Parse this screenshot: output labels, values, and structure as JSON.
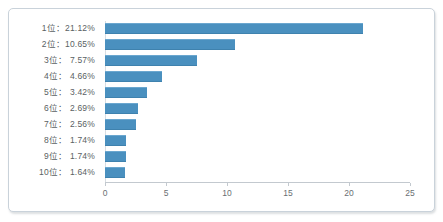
{
  "chart_data": {
    "type": "bar",
    "orientation": "horizontal",
    "title": "",
    "subtitle": "",
    "xlabel": "",
    "ylabel": "",
    "xlim": [
      0,
      25
    ],
    "xticks": [
      0,
      5,
      10,
      15,
      20,
      25
    ],
    "xtick_labels": [
      "0",
      "5",
      "10",
      "15",
      "20",
      "25"
    ],
    "grid": false,
    "legend": null,
    "bar_color": "#4a90bf",
    "categories": [
      "1位：21.12%",
      "2位：10.65%",
      "3位： 7.57%",
      "4位： 4.66%",
      "5位： 3.42%",
      "6位： 2.69%",
      "7位： 2.56%",
      "8位： 1.74%",
      "9位： 1.74%",
      "10位： 1.64%"
    ],
    "values": [
      21.12,
      10.65,
      7.57,
      4.66,
      3.42,
      2.69,
      2.56,
      1.74,
      1.74,
      1.64
    ]
  }
}
